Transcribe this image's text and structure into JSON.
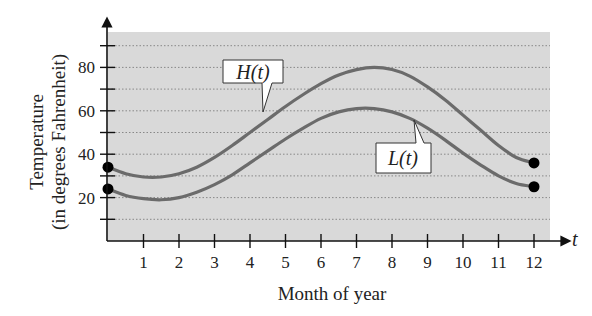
{
  "chart_data": {
    "type": "line",
    "title": "",
    "xlabel": "Month of year",
    "ylabel_line1": "Temperature",
    "ylabel_line2": "(in degrees Fahrenheit)",
    "x_axis_variable": "t",
    "xlim": [
      0,
      12
    ],
    "ylim": [
      0,
      95
    ],
    "x_ticks": [
      1,
      2,
      3,
      4,
      5,
      6,
      7,
      8,
      9,
      10,
      11,
      12
    ],
    "x_tick_labels": [
      "1",
      "2",
      "3",
      "4",
      "5",
      "6",
      "7",
      "8",
      "9",
      "10",
      "11",
      "12"
    ],
    "y_ticks": [
      10,
      20,
      30,
      40,
      50,
      60,
      70,
      80,
      90
    ],
    "y_tick_labels": [
      "20",
      "40",
      "60",
      "80"
    ],
    "y_labeled_ticks": [
      20,
      40,
      60,
      80
    ],
    "grid": "horizontal dotted",
    "background": "#d9d9d9",
    "series": [
      {
        "name": "H(t)",
        "label": "H(t)",
        "x": [
          0,
          0.5,
          1,
          1.5,
          2,
          2.5,
          3,
          3.5,
          4,
          4.5,
          5,
          5.5,
          6,
          6.5,
          7,
          7.5,
          8,
          8.5,
          9,
          9.5,
          10,
          10.5,
          11,
          11.5,
          12
        ],
        "values": [
          34,
          31,
          29.5,
          29.5,
          31,
          34,
          38.5,
          44,
          50,
          56,
          62,
          67.5,
          72.5,
          76.5,
          79,
          80,
          79,
          76,
          71,
          65,
          58,
          51,
          44,
          38.5,
          36
        ],
        "endpoints": [
          {
            "x": 0,
            "y": 34
          },
          {
            "x": 12,
            "y": 36
          }
        ]
      },
      {
        "name": "L(t)",
        "label": "L(t)",
        "x": [
          0,
          0.5,
          1,
          1.5,
          2,
          2.5,
          3,
          3.5,
          4,
          4.5,
          5,
          5.5,
          6,
          6.5,
          7,
          7.5,
          8,
          8.5,
          9,
          9.5,
          10,
          10.5,
          11,
          11.5,
          12
        ],
        "values": [
          24,
          21,
          19.5,
          19,
          20,
          22.5,
          26,
          30.5,
          36,
          41.5,
          47,
          52,
          56.5,
          59.5,
          61,
          61,
          59.5,
          56.5,
          52,
          46.5,
          40.5,
          35,
          30,
          26.5,
          25
        ],
        "endpoints": [
          {
            "x": 0,
            "y": 24
          },
          {
            "x": 12,
            "y": 25
          }
        ]
      }
    ],
    "annotations": [
      {
        "text": "H(t)",
        "points_to": "upper curve near t=4.3"
      },
      {
        "text": "L(t)",
        "points_to": "lower curve near t=8.6"
      }
    ]
  }
}
